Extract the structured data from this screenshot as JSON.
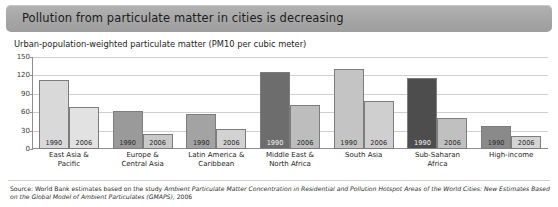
{
  "header": {
    "title": "Pollution from particulate matter in cities is decreasing"
  },
  "subtitle": "Urban-population-weighted particulate matter (PM10 per cubic meter)",
  "source": {
    "prefix": "Source: World Bank estimates based on the study ",
    "italic": "Ambient Particulate Matter Concentration in Residential and Pollution Hotspot Areas of the World Cities: New Estimates Based on the Global Model of Ambient Particulates (GMAPS)",
    "suffix": ", 2006"
  },
  "chart_data": {
    "type": "bar",
    "title": "Pollution from particulate matter in cities is decreasing",
    "subtitle": "Urban-population-weighted particulate matter (PM10 per cubic meter)",
    "xlabel": "",
    "ylabel": "",
    "ylim": [
      0,
      150
    ],
    "yticks": [
      0,
      30,
      60,
      90,
      120,
      150
    ],
    "grid": true,
    "legend": "none",
    "categories": [
      "East Asia & Pacific",
      "Europe & Central Asia",
      "Latin America & Caribbean",
      "Middle East & North Africa",
      "South Asia",
      "Sub-Saharan Africa",
      "High-income"
    ],
    "series": [
      {
        "name": "1990",
        "values": [
          112,
          62,
          57,
          125,
          131,
          116,
          37
        ]
      },
      {
        "name": "2006",
        "values": [
          68,
          24,
          33,
          71,
          79,
          51,
          21
        ]
      }
    ],
    "bar_colors": {
      "east-asia-pacific": {
        "1990": "#d9d9d9",
        "2006": "#e2e2e2"
      },
      "europe-central-asia": {
        "1990": "#9a9a9a",
        "2006": "#c9c9c9"
      },
      "latin-america-caribbean": {
        "1990": "#a3a3a3",
        "2006": "#d2d2d2"
      },
      "middle-east-north-africa": {
        "1990": "#6d6d6d",
        "2006": "#bdbdbd"
      },
      "south-asia": {
        "1990": "#c4c4c4",
        "2006": "#cfcfcf"
      },
      "sub-saharan-africa": {
        "1990": "#4d4d4d",
        "2006": "#c0c0c0"
      },
      "high-income": {
        "1990": "#8a8a8a",
        "2006": "#d4d4d4"
      }
    },
    "bar_labels": [
      "1990",
      "2006"
    ]
  },
  "colors": {
    "banner": "#a6a6a6",
    "axis": "#8e8e8e",
    "grid": "#cfcfcf",
    "text": "#1c1c1c"
  }
}
